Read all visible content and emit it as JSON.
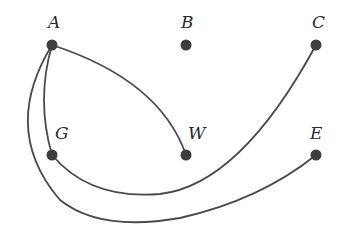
{
  "diagram": {
    "type": "graph",
    "directed": false,
    "colors": {
      "node": "#3e3e3e",
      "edge": "#4a4a4a",
      "label": "#2a2a2a",
      "background": "#ffffff"
    },
    "nodes": [
      {
        "id": "A",
        "label": "A",
        "x": 52,
        "y": 45,
        "label_x": 48,
        "label_y": 28
      },
      {
        "id": "B",
        "label": "B",
        "x": 186,
        "y": 45,
        "label_x": 181,
        "label_y": 28
      },
      {
        "id": "C",
        "label": "C",
        "x": 316,
        "y": 45,
        "label_x": 312,
        "label_y": 28
      },
      {
        "id": "G",
        "label": "G",
        "x": 52,
        "y": 155,
        "label_x": 55,
        "label_y": 139
      },
      {
        "id": "W",
        "label": "W",
        "x": 186,
        "y": 155,
        "label_x": 188,
        "label_y": 139
      },
      {
        "id": "E",
        "label": "E",
        "x": 316,
        "y": 155,
        "label_x": 310,
        "label_y": 139
      }
    ],
    "edges": [
      {
        "from": "A",
        "to": "W",
        "path": "M52,45 Q160,80 186,155"
      },
      {
        "from": "A",
        "to": "G",
        "path": "M52,45 Q36,100 52,155"
      },
      {
        "from": "G",
        "to": "C",
        "path": "M52,155 Q90,200 160,194 Q240,185 316,45"
      },
      {
        "from": "A",
        "to": "E",
        "path": "M52,45 Q0,130 60,200 Q100,232 180,218 Q260,200 316,155"
      }
    ]
  }
}
